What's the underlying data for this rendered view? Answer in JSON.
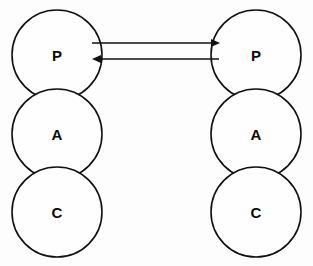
{
  "diagram": {
    "background_color": "#fdfdfd",
    "stroke_color": "#111111",
    "fill_color": "#fefefe",
    "columns": [
      {
        "id": "left-agent",
        "name": "left-agent",
        "cx": 57,
        "nodes": [
          {
            "label": "P",
            "name": "presentation",
            "cy": 55,
            "r": 45
          },
          {
            "label": "A",
            "name": "abstraction",
            "cy": 134,
            "r": 45
          },
          {
            "label": "C",
            "name": "control",
            "cy": 212,
            "r": 45
          }
        ]
      },
      {
        "id": "right-agent",
        "name": "right-agent",
        "cx": 256,
        "nodes": [
          {
            "label": "P",
            "name": "presentation",
            "cy": 55,
            "r": 45
          },
          {
            "label": "A",
            "name": "abstraction",
            "cy": 134,
            "r": 45
          },
          {
            "label": "C",
            "name": "control",
            "cy": 212,
            "r": 45
          }
        ]
      }
    ],
    "links": [
      {
        "name": "arrow-left-to-right",
        "direction": "right",
        "x1": 92,
        "x2": 219,
        "y": 43
      },
      {
        "name": "arrow-right-to-left",
        "direction": "left",
        "x1": 219,
        "x2": 92,
        "y": 59
      }
    ]
  }
}
